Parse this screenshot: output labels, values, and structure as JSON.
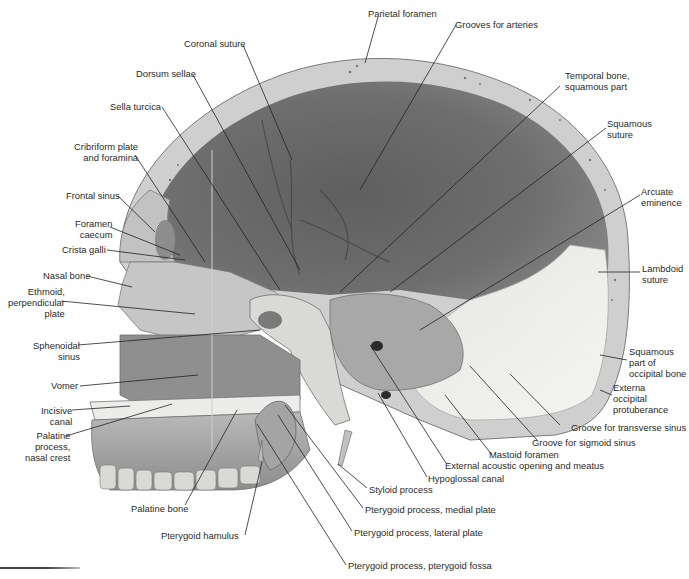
{
  "figure": {
    "type": "anatomical-illustration",
    "colors": {
      "background": "#ffffff",
      "cranial_cavity_dark": "#6b6b6b",
      "cranial_cavity_mid": "#8a8a8a",
      "bone_outer_table": "#c9c9c9",
      "bone_light": "#e2e2e2",
      "bone_pale": "#f1f1ee",
      "leader_line": "#222222",
      "label_text": "#2a2a2a"
    }
  },
  "labels": {
    "parietal_foramen": "Parietal foramen",
    "grooves_for_arteries": "Grooves for arteries",
    "coronal_suture": "Coronal suture",
    "dorsum_sellae": "Dorsum sellae",
    "temporal_bone": "Temporal bone,\nsquamous part",
    "sella_turcica": "Sella turcica",
    "squamous_suture": "Squamous\nsuture",
    "cribriform_plate": "Cribriform plate\nand foramina",
    "arcuate_eminence": "Arcuate\neminence",
    "frontal_sinus": "Frontal sinus",
    "foramen_caecum": "Foramen\ncaecum",
    "crista_galli": "Crista galli",
    "nasal_bone": "Nasal bone",
    "lambdoid_suture": "Lambdoid\nsuture",
    "ethmoid": "Ethmoid,\nperpendicular\nplate",
    "sphenoidal_sinus": "Sphenoidal\nsinus",
    "squamous_occipital": "Squamous\npart of\noccipital bone",
    "vomer": "Vomer",
    "externa_occipital": "Externa\noccipital\nprotuberance",
    "incisive_canal": "Incisive\ncanal",
    "palatine_process": "Palatine\nprocess,\nnasal crest",
    "groove_transverse": "Groove for transverse sinus",
    "groove_sigmoid": "Groove for sigmoid sinus",
    "mastoid_foramen": "Mastoid foramen",
    "external_acoustic": "External acoustic opening and meatus",
    "hypoglossal_canal": "Hypoglossal canal",
    "styloid_process": "Styloid process",
    "palatine_bone": "Palatine bone",
    "pterygoid_medial": "Pterygoid process, medial plate",
    "pterygoid_hamulus": "Pterygoid hamulus",
    "pterygoid_lateral": "Pterygoid process, lateral plate",
    "pterygoid_fossa": "Pterygoid process, pterygoid fossa"
  }
}
